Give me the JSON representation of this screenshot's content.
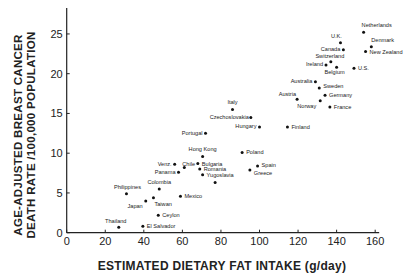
{
  "chart_data": {
    "type": "scatter",
    "title": "",
    "xlabel": "ESTIMATED DIETARY FAT INTAKE (g/day)",
    "ylabel_lines": [
      "AGE-ADJUSTED BREAST CANCER",
      "DEATH RATE /100,000 POPULATION"
    ],
    "xlim": [
      0,
      160
    ],
    "ylim": [
      0,
      28
    ],
    "x_ticks": [
      0,
      20,
      40,
      60,
      80,
      100,
      120,
      140,
      160
    ],
    "y_ticks": [
      0,
      5,
      10,
      15,
      20,
      25
    ],
    "grid": false,
    "legend": null,
    "points": [
      {
        "label": "Netherlands",
        "x": 154,
        "y": 25.2,
        "lx": -2,
        "ly": -5,
        "anchor": "start"
      },
      {
        "label": "U.K.",
        "x": 142,
        "y": 23.9,
        "lx": -4,
        "ly": -5,
        "anchor": "middle"
      },
      {
        "label": "Denmark",
        "x": 158,
        "y": 23.4,
        "lx": 0,
        "ly": -5,
        "anchor": "start"
      },
      {
        "label": "Canada",
        "x": 143.5,
        "y": 23.0,
        "lx": -3,
        "ly": 1,
        "anchor": "end"
      },
      {
        "label": "New Zealand",
        "x": 155,
        "y": 22.8,
        "lx": 4,
        "ly": 3,
        "anchor": "start"
      },
      {
        "label": "Switzerland",
        "x": 137,
        "y": 21.5,
        "lx": -1,
        "ly": -4,
        "anchor": "middle"
      },
      {
        "label": "Ireland",
        "x": 134.5,
        "y": 21.1,
        "lx": -3,
        "ly": 1.5,
        "anchor": "end"
      },
      {
        "label": "Belgium",
        "x": 140,
        "y": 20.8,
        "lx": -2,
        "ly": 7,
        "anchor": "middle"
      },
      {
        "label": "U.S.",
        "x": 149,
        "y": 20.7,
        "lx": 4,
        "ly": 2,
        "anchor": "start"
      },
      {
        "label": "Australia",
        "x": 129,
        "y": 19.0,
        "lx": -3,
        "ly": 1.5,
        "anchor": "end"
      },
      {
        "label": "Sweden",
        "x": 131,
        "y": 18.2,
        "lx": 4,
        "ly": 0,
        "anchor": "start"
      },
      {
        "label": "Austria",
        "x": 119.5,
        "y": 16.8,
        "lx": -1,
        "ly": -3,
        "anchor": "end"
      },
      {
        "label": "Germany",
        "x": 134,
        "y": 17.3,
        "lx": 4,
        "ly": 1.5,
        "anchor": "start"
      },
      {
        "label": "Norway",
        "x": 131.5,
        "y": 16.6,
        "lx": -4,
        "ly": 7,
        "anchor": "end"
      },
      {
        "label": "France",
        "x": 136.5,
        "y": 15.8,
        "lx": 4,
        "ly": 2,
        "anchor": "start"
      },
      {
        "label": "Italy",
        "x": 86,
        "y": 15.5,
        "lx": 0,
        "ly": -5,
        "anchor": "middle"
      },
      {
        "label": "Czechoslovakia",
        "x": 95.5,
        "y": 14.5,
        "lx": -2,
        "ly": 1.5,
        "anchor": "end"
      },
      {
        "label": "Hungary",
        "x": 100,
        "y": 13.3,
        "lx": -3,
        "ly": 1.5,
        "anchor": "end"
      },
      {
        "label": "Finland",
        "x": 114.5,
        "y": 13.3,
        "lx": 4,
        "ly": 2,
        "anchor": "start"
      },
      {
        "label": "Portugal",
        "x": 72,
        "y": 12.5,
        "lx": -3,
        "ly": 1.5,
        "anchor": "end"
      },
      {
        "label": "Hong Kong",
        "x": 70.5,
        "y": 9.6,
        "lx": 0,
        "ly": -5,
        "anchor": "middle"
      },
      {
        "label": "Poland",
        "x": 91,
        "y": 10.1,
        "lx": 4,
        "ly": 2,
        "anchor": "start"
      },
      {
        "label": "Venz.",
        "x": 56,
        "y": 8.6,
        "lx": -3,
        "ly": 1.5,
        "anchor": "end"
      },
      {
        "label": "Chile",
        "x": 61,
        "y": 8.2,
        "lx": -2,
        "ly": -2,
        "anchor": "start"
      },
      {
        "label": "Bulgaria",
        "x": 68,
        "y": 8.7,
        "lx": 4,
        "ly": 2,
        "anchor": "start"
      },
      {
        "label": "Spain",
        "x": 99,
        "y": 8.4,
        "lx": 4,
        "ly": 1,
        "anchor": "start"
      },
      {
        "label": "Romania",
        "x": 69,
        "y": 8.0,
        "lx": 4,
        "ly": 2,
        "anchor": "start"
      },
      {
        "label": "Panama",
        "x": 58,
        "y": 7.6,
        "lx": -3,
        "ly": 1.5,
        "anchor": "end"
      },
      {
        "label": "Greece",
        "x": 95,
        "y": 7.9,
        "lx": 4,
        "ly": 5,
        "anchor": "start"
      },
      {
        "label": "Yugoslavia",
        "x": 70.5,
        "y": 7.3,
        "lx": 4,
        "ly": 2,
        "anchor": "start"
      },
      {
        "label": "",
        "x": 77,
        "y": 6.3,
        "lx": 0,
        "ly": 0,
        "anchor": "start"
      },
      {
        "label": "Colombia",
        "x": 48,
        "y": 5.5,
        "lx": 0,
        "ly": -5,
        "anchor": "middle"
      },
      {
        "label": "Philippines",
        "x": 31,
        "y": 4.9,
        "lx": 1,
        "ly": -5,
        "anchor": "middle"
      },
      {
        "label": "Mexico",
        "x": 59,
        "y": 4.6,
        "lx": 4,
        "ly": 2,
        "anchor": "start"
      },
      {
        "label": "Taiwan",
        "x": 45,
        "y": 4.4,
        "lx": 1,
        "ly": 8,
        "anchor": "start"
      },
      {
        "label": "Japan",
        "x": 41,
        "y": 4.0,
        "lx": -3,
        "ly": 7,
        "anchor": "end"
      },
      {
        "label": "Ceylon",
        "x": 47.5,
        "y": 2.2,
        "lx": 4,
        "ly": 2,
        "anchor": "start"
      },
      {
        "label": "Thailand",
        "x": 27,
        "y": 0.7,
        "lx": -3,
        "ly": -4,
        "anchor": "middle"
      },
      {
        "label": "El Salvador",
        "x": 39.5,
        "y": 0.8,
        "lx": 4,
        "ly": 2,
        "anchor": "start"
      }
    ]
  }
}
